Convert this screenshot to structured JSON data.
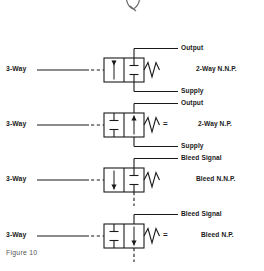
{
  "figure": {
    "caption": "Figure 10",
    "top_mark": "partial-logo-glyph"
  },
  "colors": {
    "line": "#1a1a1a",
    "text": "#1a1a1a",
    "caption": "#555555",
    "background": "#ffffff"
  },
  "rows": [
    {
      "id": "row-1",
      "input_label": "3-Way",
      "top_port_label": "Output",
      "bottom_port_label": "Supply",
      "type_label": "2-Way N.N.P.",
      "equals_sign": "",
      "left_cell_symbol": "arrow-down",
      "right_cell_symbol": "blocked-tee",
      "actuator_symbol": "spring",
      "has_bleed_line": false,
      "has_supply_line": true
    },
    {
      "id": "row-2",
      "input_label": "3-Way",
      "top_port_label": "Output",
      "bottom_port_label": "Supply",
      "type_label": "2-Way N.P.",
      "equals_sign": "=",
      "left_cell_symbol": "blocked-tee",
      "right_cell_symbol": "arrow-up",
      "actuator_symbol": "spring",
      "has_bleed_line": false,
      "has_supply_line": true
    },
    {
      "id": "row-3",
      "input_label": "3-Way",
      "top_port_label": "Bleed Signal",
      "bottom_port_label": "",
      "type_label": "Bleed N.N.P.",
      "equals_sign": "",
      "left_cell_symbol": "arrow-down",
      "right_cell_symbol": "blocked-tee",
      "actuator_symbol": "spring",
      "has_bleed_line": true,
      "has_supply_line": false
    },
    {
      "id": "row-4",
      "input_label": "3-Way",
      "top_port_label": "Bleed Signal",
      "bottom_port_label": "",
      "type_label": "Bleed N.P.",
      "equals_sign": "=",
      "left_cell_symbol": "blocked-tee",
      "right_cell_symbol": "arrow-down",
      "actuator_symbol": "spring",
      "has_bleed_line": true,
      "has_supply_line": false
    }
  ]
}
